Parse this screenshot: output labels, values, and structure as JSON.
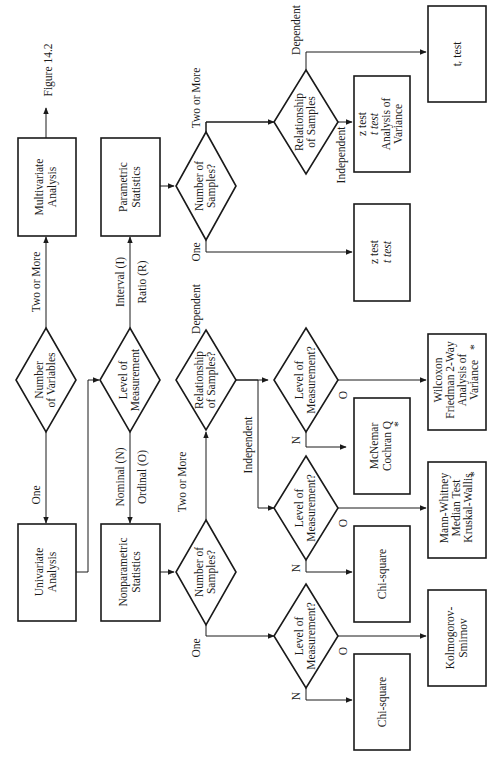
{
  "diagram": {
    "orientation": "rotated 90 degrees counter-clockwise",
    "nodes": {
      "multivariate": {
        "lines": [
          "Multivariate",
          "Analysis"
        ]
      },
      "figure_ref": {
        "label": "Figure 14.2"
      },
      "num_variables": {
        "lines": [
          "Number",
          "of Variables"
        ]
      },
      "univariate": {
        "lines": [
          "Univariate",
          "Analysis"
        ]
      },
      "parametric": {
        "lines": [
          "Parametric",
          "Statistics"
        ]
      },
      "level_main": {
        "lines": [
          "Level of",
          "Measurement"
        ]
      },
      "nonparametric": {
        "lines": [
          "Nonparametric",
          "Statistics"
        ]
      },
      "param_num_samples": {
        "lines": [
          "Number of",
          "Samples?"
        ]
      },
      "param_relationship": {
        "lines": [
          "Relationship",
          "of Samples"
        ]
      },
      "param_one_result": {
        "lines": [
          "z test",
          "t test"
        ]
      },
      "param_indep_result": {
        "lines": [
          "z test",
          "t test",
          "Analysis of",
          "Variance"
        ]
      },
      "param_dep_result": {
        "lines": [
          "tᵣ test"
        ]
      },
      "nonparam_num_samples": {
        "lines": [
          "Number of",
          "Samples?"
        ]
      },
      "nonparam_relationship": {
        "lines": [
          "Relationship",
          "of Samples?"
        ]
      },
      "level_dep": {
        "lines": [
          "Level of",
          "Measurement?"
        ]
      },
      "level_indep": {
        "lines": [
          "Level of",
          "Measurement?"
        ]
      },
      "level_one": {
        "lines": [
          "Level of",
          "Measurement?"
        ]
      },
      "mcnemar": {
        "lines": [
          "McNemar",
          "Cochran Q"
        ],
        "mark": "*"
      },
      "wilcoxon": {
        "lines": [
          "Wilcoxon",
          "Friedman 2-Way",
          "Analysis of",
          "Variance"
        ],
        "mark": "*"
      },
      "chisq_indep": {
        "lines": [
          "Chi-square"
        ]
      },
      "mann_whitney": {
        "lines": [
          "Mann-Whitney",
          "Median Test",
          "Kruskal-Wallis"
        ],
        "mark": "*"
      },
      "chisq_one": {
        "lines": [
          "Chi-square"
        ]
      },
      "kolmogorov": {
        "lines": [
          "Kolmogorov-",
          "Smirnov"
        ]
      }
    },
    "edge_labels": {
      "two_or_more_vars": "Two or More",
      "one_var": "One",
      "interval": "Interval (I)",
      "ratio": "Ratio (R)",
      "nominal": "Nominal (N)",
      "ordinal": "Ordinal (O)",
      "param_two_or_more": "Two or More",
      "param_one": "One",
      "param_independent": "Independent",
      "param_dependent": "Dependent",
      "np_two_or_more": "Two or More",
      "np_one": "One",
      "np_independent": "Independent",
      "np_dependent": "Dependent",
      "n": "N",
      "o": "O"
    }
  }
}
